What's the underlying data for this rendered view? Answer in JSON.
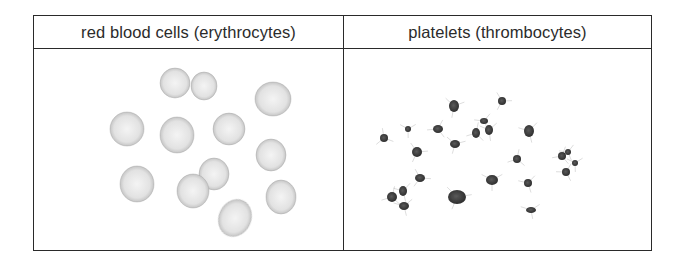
{
  "table": {
    "columns": [
      {
        "header": "red blood cells  (erythrocytes)",
        "image": "red-blood-cells-illustration"
      },
      {
        "header": "platelets (thrombocytes)",
        "image": "platelets-illustration"
      }
    ]
  },
  "colors": {
    "border": "#2a2a2a",
    "text": "#2b2b2b",
    "rbc_fill": "#e4e4e4",
    "rbc_edge": "#9a9a9a",
    "platelet_fill": "#3c3c3c"
  },
  "red_blood_cells": [
    {
      "cx": 175,
      "cy": 83,
      "rx": 15,
      "ry": 15
    },
    {
      "cx": 204,
      "cy": 86,
      "rx": 13,
      "ry": 14
    },
    {
      "cx": 273,
      "cy": 99,
      "rx": 18,
      "ry": 17
    },
    {
      "cx": 127,
      "cy": 129,
      "rx": 17,
      "ry": 17
    },
    {
      "cx": 177,
      "cy": 135,
      "rx": 17,
      "ry": 18
    },
    {
      "cx": 229,
      "cy": 129,
      "rx": 16,
      "ry": 16
    },
    {
      "cx": 271,
      "cy": 155,
      "rx": 15,
      "ry": 16
    },
    {
      "cx": 137,
      "cy": 184,
      "rx": 17,
      "ry": 18
    },
    {
      "cx": 214,
      "cy": 174,
      "rx": 15,
      "ry": 16
    },
    {
      "cx": 193,
      "cy": 191,
      "rx": 16,
      "ry": 17
    },
    {
      "cx": 281,
      "cy": 197,
      "rx": 15,
      "ry": 17
    },
    {
      "cx": 235,
      "cy": 218,
      "rx": 16,
      "ry": 19
    }
  ],
  "platelets": [
    {
      "cx": 454,
      "cy": 106,
      "rx": 5,
      "ry": 6
    },
    {
      "cx": 502,
      "cy": 101,
      "rx": 4,
      "ry": 4
    },
    {
      "cx": 384,
      "cy": 138,
      "rx": 4,
      "ry": 4
    },
    {
      "cx": 408,
      "cy": 129,
      "rx": 3,
      "ry": 3
    },
    {
      "cx": 438,
      "cy": 129,
      "rx": 5,
      "ry": 4
    },
    {
      "cx": 484,
      "cy": 121,
      "rx": 4,
      "ry": 3
    },
    {
      "cx": 476,
      "cy": 133,
      "rx": 4,
      "ry": 5
    },
    {
      "cx": 489,
      "cy": 130,
      "rx": 4,
      "ry": 5
    },
    {
      "cx": 529,
      "cy": 131,
      "rx": 5,
      "ry": 6
    },
    {
      "cx": 455,
      "cy": 144,
      "rx": 5,
      "ry": 4
    },
    {
      "cx": 417,
      "cy": 152,
      "rx": 5,
      "ry": 5
    },
    {
      "cx": 517,
      "cy": 159,
      "rx": 4,
      "ry": 4
    },
    {
      "cx": 562,
      "cy": 156,
      "rx": 4,
      "ry": 4
    },
    {
      "cx": 568,
      "cy": 152,
      "rx": 3,
      "ry": 3
    },
    {
      "cx": 575,
      "cy": 163,
      "rx": 3,
      "ry": 3
    },
    {
      "cx": 566,
      "cy": 172,
      "rx": 4,
      "ry": 4
    },
    {
      "cx": 420,
      "cy": 178,
      "rx": 5,
      "ry": 4
    },
    {
      "cx": 492,
      "cy": 180,
      "rx": 6,
      "ry": 5
    },
    {
      "cx": 528,
      "cy": 183,
      "rx": 4,
      "ry": 4
    },
    {
      "cx": 392,
      "cy": 197,
      "rx": 5,
      "ry": 5
    },
    {
      "cx": 403,
      "cy": 191,
      "rx": 4,
      "ry": 5
    },
    {
      "cx": 404,
      "cy": 206,
      "rx": 5,
      "ry": 4
    },
    {
      "cx": 457,
      "cy": 197,
      "rx": 9,
      "ry": 7
    },
    {
      "cx": 531,
      "cy": 210,
      "rx": 5,
      "ry": 3
    }
  ]
}
